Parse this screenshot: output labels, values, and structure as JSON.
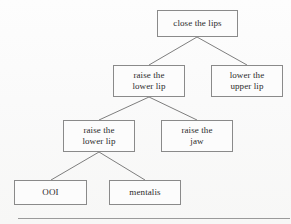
{
  "diagram": {
    "type": "tree",
    "background_color": "#fbfbfb",
    "box_border_color": "#8a8a8a",
    "box_fill_color": "#fcfcfc",
    "edge_color": "#6f6f6f",
    "text_color": "#2b2b2b",
    "baseline_rule_color": "#9a9a9a",
    "nodes": [
      {
        "id": "n0",
        "label_line1": "close the lips",
        "label_line2": "",
        "x": 157,
        "y": 10,
        "w": 81,
        "h": 27,
        "level": 0
      },
      {
        "id": "n1",
        "label_line1": "raise the",
        "label_line2": "lower lip",
        "x": 113,
        "y": 65,
        "w": 72,
        "h": 32,
        "level": 1
      },
      {
        "id": "n2",
        "label_line1": "lower the",
        "label_line2": "upper lip",
        "x": 211,
        "y": 65,
        "w": 72,
        "h": 32,
        "level": 1
      },
      {
        "id": "n3",
        "label_line1": "raise the",
        "label_line2": "lower lip",
        "x": 63,
        "y": 120,
        "w": 72,
        "h": 32,
        "level": 2
      },
      {
        "id": "n4",
        "label_line1": "raise the",
        "label_line2": "jaw",
        "x": 161,
        "y": 120,
        "w": 72,
        "h": 32,
        "level": 2
      },
      {
        "id": "n5",
        "label_line1": "OOI",
        "label_line2": "",
        "x": 14,
        "y": 180,
        "w": 73,
        "h": 25,
        "level": 3
      },
      {
        "id": "n6",
        "label_line1": "mentalis",
        "label_line2": "",
        "x": 109,
        "y": 180,
        "w": 72,
        "h": 25,
        "level": 3
      }
    ],
    "edges": [
      {
        "from": "n0",
        "to": "n1",
        "x1": 197,
        "y1": 37,
        "x2": 149,
        "y2": 65
      },
      {
        "from": "n0",
        "to": "n2",
        "x1": 197,
        "y1": 37,
        "x2": 247,
        "y2": 65
      },
      {
        "from": "n1",
        "to": "n3",
        "x1": 149,
        "y1": 97,
        "x2": 99,
        "y2": 120
      },
      {
        "from": "n1",
        "to": "n4",
        "x1": 149,
        "y1": 97,
        "x2": 197,
        "y2": 120
      },
      {
        "from": "n3",
        "to": "n5",
        "x1": 99,
        "y1": 152,
        "x2": 51,
        "y2": 180
      },
      {
        "from": "n3",
        "to": "n6",
        "x1": 99,
        "y1": 152,
        "x2": 145,
        "y2": 180
      }
    ]
  }
}
